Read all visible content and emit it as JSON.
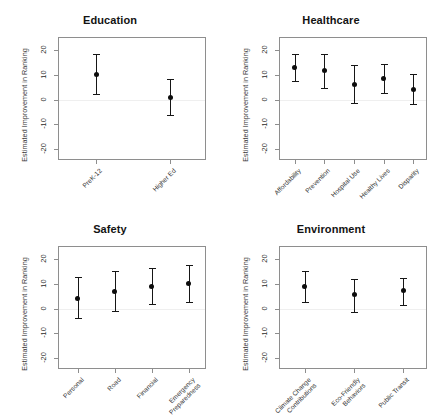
{
  "figure": {
    "ylabel": "Estimated Improvement in Ranking",
    "yticks": [
      "20",
      "10",
      "0",
      "-10",
      "-20"
    ],
    "ylim": [
      -25,
      25
    ],
    "point_color": "#0d0d0d",
    "line_color": "#161616",
    "axis_color": "#8e8e8e",
    "zeroline_color": "#efefef"
  },
  "chart_data": [
    {
      "type": "scatter",
      "title": "Education",
      "xlabel": "",
      "ylabel": "Estimated Improvement in Ranking",
      "ylim": [
        -25,
        25
      ],
      "yticks": [
        20,
        10,
        0,
        -10,
        -20
      ],
      "grid": false,
      "legend": "none",
      "annotations": [
        "horizontal reference line at y = 0"
      ],
      "categories": [
        "PreK-12",
        "Higher Ed"
      ],
      "values": [
        10.2,
        0.9
      ],
      "ci_lower": [
        2.2,
        -6.5
      ],
      "ci_upper": [
        18.3,
        8.3
      ]
    },
    {
      "type": "scatter",
      "title": "Healthcare",
      "xlabel": "",
      "ylabel": "Estimated Improvement in Ranking",
      "ylim": [
        -25,
        25
      ],
      "yticks": [
        20,
        10,
        0,
        -10,
        -20
      ],
      "grid": false,
      "legend": "none",
      "annotations": [
        "horizontal reference line at y = 0"
      ],
      "categories": [
        "Affordability",
        "Prevention",
        "Hospital Use",
        "Healthy Lives",
        "Disparity"
      ],
      "values": [
        12.9,
        11.7,
        6.1,
        8.7,
        4.2
      ],
      "ci_lower": [
        7.4,
        4.6,
        -1.5,
        2.6,
        -1.9
      ],
      "ci_upper": [
        18.6,
        18.6,
        14.0,
        14.4,
        10.4
      ]
    },
    {
      "type": "scatter",
      "title": "Safety",
      "xlabel": "",
      "ylabel": "Estimated Improvement in Ranking",
      "ylim": [
        -25,
        25
      ],
      "yticks": [
        20,
        10,
        0,
        -10,
        -20
      ],
      "grid": false,
      "legend": "none",
      "annotations": [
        "horizontal reference line at y = 0"
      ],
      "categories": [
        "Personal",
        "Road",
        "Financial",
        "Emergency\nPreparedness"
      ],
      "values": [
        4.1,
        6.8,
        9.0,
        10.2
      ],
      "ci_lower": [
        -3.9,
        -1.0,
        1.7,
        2.7
      ],
      "ci_upper": [
        13.0,
        15.4,
        16.5,
        17.6
      ]
    },
    {
      "type": "scatter",
      "title": "Environment",
      "xlabel": "",
      "ylabel": "Estimated Improvement in Ranking",
      "ylim": [
        -25,
        25
      ],
      "yticks": [
        20,
        10,
        0,
        -10,
        -20
      ],
      "grid": false,
      "legend": "none",
      "annotations": [
        "horizontal reference line at y = 0"
      ],
      "categories": [
        "Climate Change\nContributions",
        "Eco-Friendly\nBehaviors",
        "Public Transit"
      ],
      "values": [
        9.1,
        5.5,
        7.4
      ],
      "ci_lower": [
        2.7,
        -1.3,
        1.4
      ],
      "ci_upper": [
        15.2,
        11.8,
        12.6
      ]
    }
  ]
}
